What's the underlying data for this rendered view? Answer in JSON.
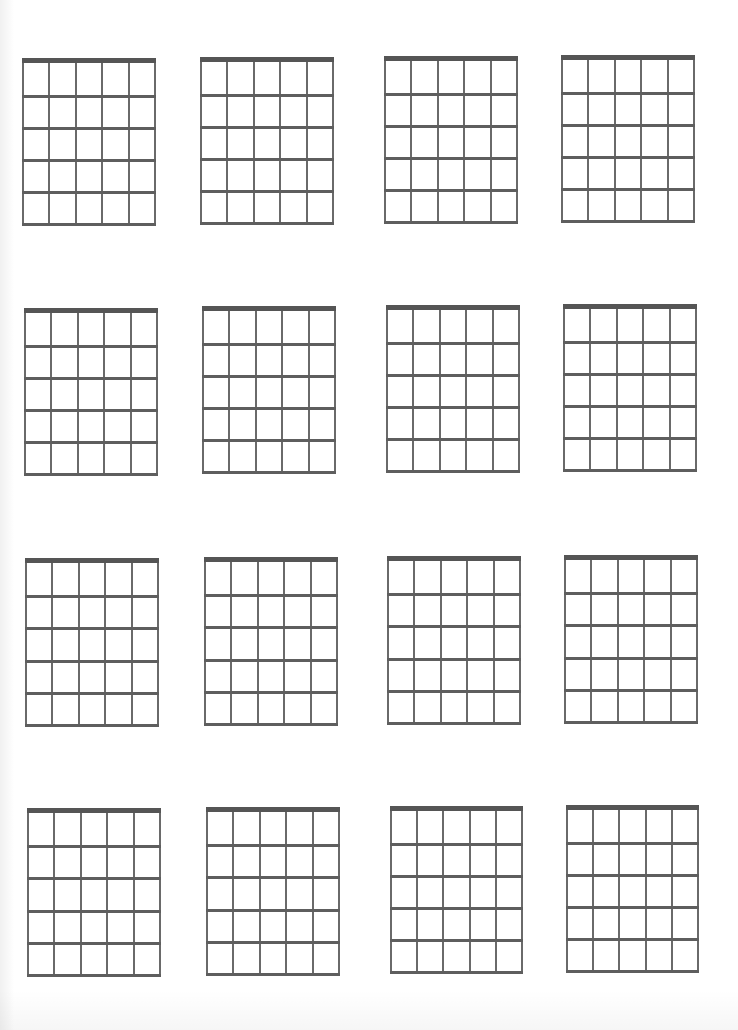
{
  "page": {
    "type": "blank guitar chord chart sheet",
    "background": "#ffffff",
    "line_color": "#666666",
    "nut_color": "#555555"
  },
  "diagram_spec": {
    "strings": 6,
    "frets": 5,
    "has_nut": true
  },
  "diagrams": [
    {
      "row": 1,
      "col": 1,
      "x": 22,
      "y": 58,
      "w": 134,
      "h": 168
    },
    {
      "row": 1,
      "col": 2,
      "x": 200,
      "y": 57,
      "w": 134,
      "h": 168
    },
    {
      "row": 1,
      "col": 3,
      "x": 384,
      "y": 56,
      "w": 134,
      "h": 168
    },
    {
      "row": 1,
      "col": 4,
      "x": 561,
      "y": 55,
      "w": 134,
      "h": 168
    },
    {
      "row": 2,
      "col": 1,
      "x": 24,
      "y": 308,
      "w": 134,
      "h": 168
    },
    {
      "row": 2,
      "col": 2,
      "x": 202,
      "y": 306,
      "w": 134,
      "h": 168
    },
    {
      "row": 2,
      "col": 3,
      "x": 386,
      "y": 305,
      "w": 134,
      "h": 168
    },
    {
      "row": 2,
      "col": 4,
      "x": 563,
      "y": 304,
      "w": 134,
      "h": 168
    },
    {
      "row": 3,
      "col": 1,
      "x": 25,
      "y": 558,
      "w": 134,
      "h": 169
    },
    {
      "row": 3,
      "col": 2,
      "x": 204,
      "y": 557,
      "w": 134,
      "h": 169
    },
    {
      "row": 3,
      "col": 3,
      "x": 387,
      "y": 556,
      "w": 134,
      "h": 169
    },
    {
      "row": 3,
      "col": 4,
      "x": 564,
      "y": 555,
      "w": 134,
      "h": 169
    },
    {
      "row": 4,
      "col": 1,
      "x": 27,
      "y": 808,
      "w": 134,
      "h": 169
    },
    {
      "row": 4,
      "col": 2,
      "x": 206,
      "y": 807,
      "w": 134,
      "h": 169
    },
    {
      "row": 4,
      "col": 3,
      "x": 390,
      "y": 806,
      "w": 133,
      "h": 168
    },
    {
      "row": 4,
      "col": 4,
      "x": 566,
      "y": 805,
      "w": 133,
      "h": 168
    }
  ]
}
